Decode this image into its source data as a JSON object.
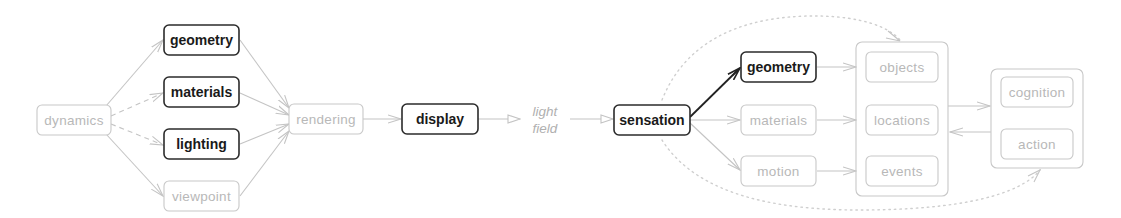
{
  "diagram": {
    "nodes": {
      "dynamics": "dynamics",
      "geometry_left": "geometry",
      "materials_left": "materials",
      "lighting": "lighting",
      "viewpoint": "viewpoint",
      "rendering": "rendering",
      "display": "display",
      "light_field_line1": "light",
      "light_field_line2": "field",
      "sensation": "sensation",
      "geometry_right": "geometry",
      "materials_right": "materials",
      "motion": "motion",
      "objects": "objects",
      "locations": "locations",
      "events": "events",
      "cognition": "cognition",
      "action": "action"
    },
    "colors": {
      "strong": "#2b2b2b",
      "faint": "#c8c8c8",
      "faint_text": "#b8b8b8"
    }
  }
}
